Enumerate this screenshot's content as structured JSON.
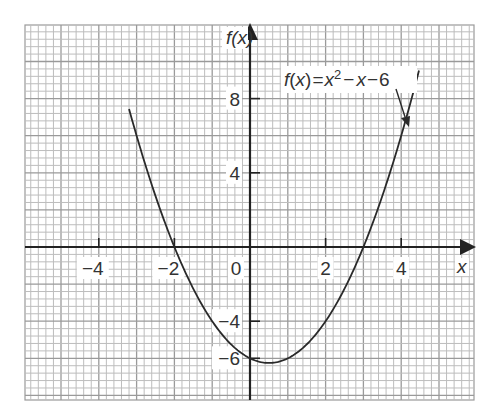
{
  "chart_data": {
    "type": "line",
    "title": "",
    "function": "f(x)=x^2-x-6",
    "xlabel": "x",
    "ylabel": "f(x)",
    "xlim": [
      -6.0,
      5.85
    ],
    "ylim": [
      -8.35,
      11.95
    ],
    "grid": true,
    "grid_minor_step": {
      "x": 0.2,
      "y": 0.4
    },
    "grid_major_step": {
      "x": 1,
      "y": 2
    },
    "x_ticks": [
      -4,
      -2,
      0,
      2,
      4
    ],
    "x_tick_labels": [
      "−4",
      "−2",
      "0",
      "2",
      "4"
    ],
    "y_ticks": [
      8,
      4,
      -4,
      -6
    ],
    "y_tick_labels": [
      "8",
      "4",
      "−4",
      "−6"
    ],
    "x_domain_plotted": [
      -3.2,
      4.47
    ],
    "series": [
      {
        "name": "f(x)=x²−x−6",
        "x": [
          -3.2,
          -3,
          -2.5,
          -2,
          -1.5,
          -1,
          -0.5,
          0,
          0.5,
          1,
          1.5,
          2,
          2.5,
          3,
          3.5,
          4,
          4.47
        ],
        "y": [
          7.44,
          6,
          2.75,
          0,
          -2.25,
          -4,
          -5.25,
          -6,
          -6.25,
          -6,
          -5.25,
          -4,
          -2.25,
          0,
          2.75,
          6,
          9.51
        ]
      }
    ],
    "annotations": [
      {
        "text_parts": {
          "f": "f",
          "x_paren": "(x)",
          "eq": "=",
          "x2": "x",
          "sup": "2",
          "rest1": "−",
          "x3": "x",
          "rest2": "−6"
        },
        "arrow_to": {
          "x": 4.2,
          "y": 6.8
        }
      }
    ],
    "legend": "none"
  },
  "labels": {
    "y_axis": "f(x)",
    "x_axis": "x",
    "eq_f": "f",
    "eq_open": "(",
    "eq_x": "x",
    "eq_close": ")",
    "eq_equals": "=",
    "eq_x2": "x",
    "eq_sup": "2",
    "eq_minus1": "−",
    "eq_x3": "x",
    "eq_minus2": "−",
    "eq_six": "6"
  },
  "colors": {
    "grid_minor": "#bdbdbd",
    "grid_major": "#9a9a9a",
    "axis": "#222222",
    "curve": "#2a2a2a",
    "text": "#333333"
  }
}
